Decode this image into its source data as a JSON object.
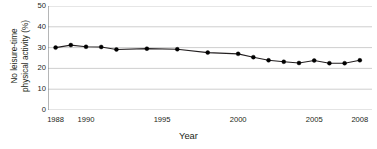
{
  "chart_data": {
    "type": "line",
    "title": "",
    "subtitle": "",
    "xlabel": "Year",
    "ylabel": "No leisure-time physical activity (%)",
    "ylabel_line1": "No leisure-time",
    "ylabel_line2": "physical activity (%)",
    "xlim": [
      1987.5,
      2008.8
    ],
    "ylim": [
      0,
      50
    ],
    "ytick_values": [
      0,
      10,
      20,
      30,
      40,
      50
    ],
    "ytick_labels": [
      "0",
      "10",
      "20",
      "30",
      "40",
      "50"
    ],
    "xtick_values": [
      1988,
      1989,
      1990,
      1991,
      1992,
      1993,
      1994,
      1995,
      1996,
      1997,
      1998,
      1999,
      2000,
      2001,
      2002,
      2003,
      2004,
      2005,
      2006,
      2007,
      2008
    ],
    "xtick_labels_shown": [
      {
        "value": 1988,
        "label": "1988"
      },
      {
        "value": 1990,
        "label": "1990"
      },
      {
        "value": 1995,
        "label": "1995"
      },
      {
        "value": 2000,
        "label": "2000"
      },
      {
        "value": 2005,
        "label": "2005"
      },
      {
        "value": 2008,
        "label": "2008"
      }
    ],
    "grid": "horizontal",
    "grid_color": "#c8c8c8",
    "legend": "none",
    "line_color": "#231f20",
    "marker": "filled-circle",
    "marker_color": "#000000",
    "x": [
      1988,
      1989,
      1990,
      1991,
      1992,
      1994,
      1996,
      1998,
      2000,
      2001,
      2002,
      2003,
      2004,
      2005,
      2006,
      2007,
      2008
    ],
    "values": [
      30.0,
      31.2,
      30.4,
      30.3,
      29.1,
      29.5,
      29.2,
      27.6,
      27.0,
      25.4,
      23.9,
      23.2,
      22.6,
      23.8,
      22.5,
      22.5,
      23.9
    ],
    "series": [
      {
        "name": "No leisure-time physical activity",
        "points": [
          {
            "x": 1988,
            "y": 30.0
          },
          {
            "x": 1989,
            "y": 31.2
          },
          {
            "x": 1990,
            "y": 30.4
          },
          {
            "x": 1991,
            "y": 30.3
          },
          {
            "x": 1992,
            "y": 29.1
          },
          {
            "x": 1994,
            "y": 29.5
          },
          {
            "x": 1996,
            "y": 29.2
          },
          {
            "x": 1998,
            "y": 27.6
          },
          {
            "x": 2000,
            "y": 27.0
          },
          {
            "x": 2001,
            "y": 25.4
          },
          {
            "x": 2002,
            "y": 23.9
          },
          {
            "x": 2003,
            "y": 23.2
          },
          {
            "x": 2004,
            "y": 22.6
          },
          {
            "x": 2005,
            "y": 23.8
          },
          {
            "x": 2006,
            "y": 22.5
          },
          {
            "x": 2007,
            "y": 22.5
          },
          {
            "x": 2008,
            "y": 23.9
          }
        ]
      }
    ]
  }
}
